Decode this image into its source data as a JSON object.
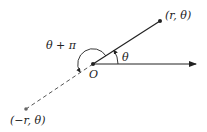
{
  "diagram": {
    "labels": {
      "point_positive": "(r, θ)",
      "point_negative": "(−r, θ)",
      "origin": "O",
      "angle_theta": "θ",
      "angle_theta_plus_pi": "θ + π"
    },
    "colors": {
      "line": "#222222",
      "dashed_line": "#555555",
      "point_negative": "#666666"
    }
  }
}
